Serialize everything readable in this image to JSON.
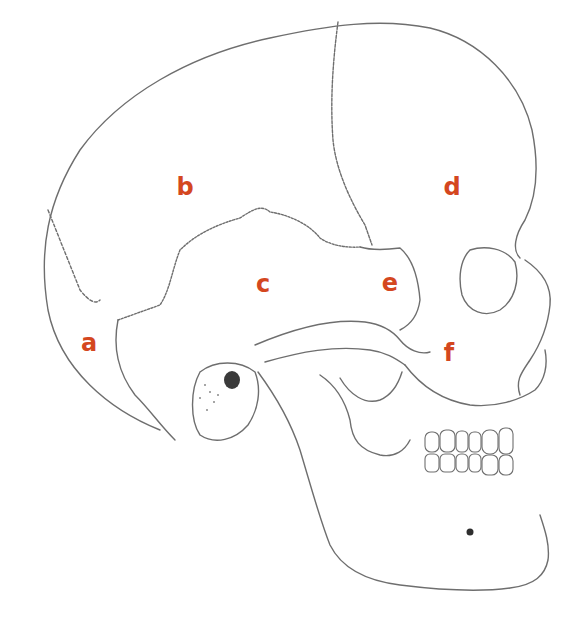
{
  "figure": {
    "label_color": "#d4471f",
    "line_color": "#6e6e6e",
    "labels": [
      {
        "id": "a",
        "text": "a",
        "x": 89,
        "y": 343
      },
      {
        "id": "b",
        "text": "b",
        "x": 185,
        "y": 187
      },
      {
        "id": "c",
        "text": "c",
        "x": 263,
        "y": 284
      },
      {
        "id": "d",
        "text": "d",
        "x": 452,
        "y": 187
      },
      {
        "id": "e",
        "text": "e",
        "x": 390,
        "y": 283
      },
      {
        "id": "f",
        "text": "f",
        "x": 449,
        "y": 353
      }
    ]
  }
}
